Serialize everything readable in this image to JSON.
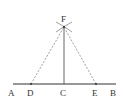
{
  "diagram": {
    "points": {
      "A": {
        "label": "A",
        "x": 13,
        "y": 84
      },
      "D": {
        "label": "D",
        "x": 31,
        "y": 84
      },
      "C": {
        "label": "C",
        "x": 64,
        "y": 84
      },
      "E": {
        "label": "E",
        "x": 96,
        "y": 84
      },
      "B": {
        "label": "B",
        "x": 116,
        "y": 84
      },
      "F": {
        "label": "F",
        "x": 64,
        "y": 27
      }
    },
    "segments": [
      {
        "from": "A",
        "to": "B",
        "style": "solid"
      },
      {
        "from": "C",
        "to": "F",
        "style": "solid"
      },
      {
        "from": "D",
        "to": "F",
        "style": "dashed"
      },
      {
        "from": "E",
        "to": "F",
        "style": "dashed"
      }
    ],
    "colors": {
      "line": "#444444",
      "dashed": "#888888",
      "text": "#333333"
    }
  }
}
